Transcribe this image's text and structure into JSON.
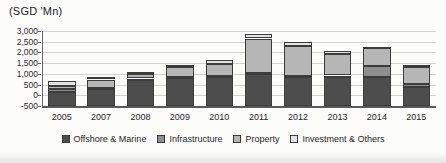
{
  "title": "(SGD 'Mn)",
  "chart_data": {
    "type": "bar",
    "stacked": true,
    "title": "(SGD 'Mn)",
    "categories": [
      "2005",
      "2007",
      "2008",
      "2009",
      "2010",
      "2011",
      "2012",
      "2013",
      "2014",
      "2015"
    ],
    "series": [
      {
        "name": "Offshore & Marine",
        "color": "#4d4d4d",
        "values": [
          150,
          270,
          740,
          820,
          850,
          1020,
          870,
          875,
          860,
          370
        ]
      },
      {
        "name": "Infrastructure",
        "color": "#8e8e8e",
        "values": [
          150,
          60,
          40,
          30,
          30,
          30,
          50,
          45,
          500,
          160
        ]
      },
      {
        "name": "Property",
        "color": "#b6b6b6",
        "values": [
          150,
          400,
          200,
          450,
          600,
          1600,
          1400,
          1000,
          830,
          770
        ]
      },
      {
        "name": "Investment & Others",
        "color": "#e2e2e2",
        "values": [
          200,
          100,
          100,
          100,
          190,
          200,
          180,
          170,
          85,
          100
        ]
      }
    ],
    "totals": [
      650,
      830,
      1080,
      1400,
      1670,
      2850,
      2500,
      2090,
      2275,
      1400
    ],
    "ylim": [
      -500,
      3000
    ],
    "ytick_step": 500,
    "ytick_labels": [
      "-500",
      "0",
      "500",
      "1,000",
      "1,500",
      "2,000",
      "2,500",
      "3,000"
    ],
    "grid": true,
    "legend_position": "bottom",
    "bars_rest_on_plot_floor": true
  }
}
